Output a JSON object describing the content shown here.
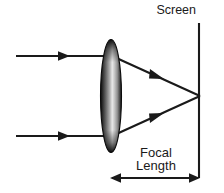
{
  "figure": {
    "type": "optics-ray-diagram",
    "background_color": "#ffffff",
    "ink_color": "#1a1a1a"
  },
  "labels": {
    "screen": "Screen",
    "focal_line1": "Focal",
    "focal_line2": "Length"
  },
  "elements": {
    "lens": {
      "name": "converging-lens",
      "center_x": 111,
      "center_y": 96,
      "rx": 10,
      "ry": 56,
      "edge_color": "#121212",
      "highlight_color": "#f2f2f2",
      "mid_color": "#8a8a8a"
    },
    "screen": {
      "name": "screen-line",
      "x": 199,
      "y_top": 23,
      "y_bottom": 178,
      "color": "#1a1a1a"
    },
    "focal_point": {
      "x": 199,
      "y": 96
    },
    "incoming_rays": [
      {
        "name": "upper-incoming-ray",
        "x1": 16,
        "y1": 56,
        "x2": 111,
        "y2": 56,
        "arrow_at": 0.52
      },
      {
        "name": "lower-incoming-ray",
        "x1": 16,
        "y1": 136,
        "x2": 111,
        "y2": 136,
        "arrow_at": 0.52
      }
    ],
    "refracted_rays": [
      {
        "name": "upper-refracted-ray",
        "x1": 113,
        "y1": 56,
        "x2": 199,
        "y2": 96,
        "arrow_at": 0.55
      },
      {
        "name": "lower-refracted-ray",
        "x1": 113,
        "y1": 136,
        "x2": 199,
        "y2": 96,
        "arrow_at": 0.55
      }
    ],
    "focal_length_arrow": {
      "name": "focal-length-dimension-arrow",
      "x1": 111,
      "x2": 199,
      "y": 178,
      "double_headed": true
    }
  },
  "text_positions": {
    "screen": {
      "x": 196,
      "y": 14,
      "anchor": "end"
    },
    "focal_line1": {
      "x": 156,
      "y": 157
    },
    "focal_line2": {
      "x": 156,
      "y": 170
    }
  }
}
